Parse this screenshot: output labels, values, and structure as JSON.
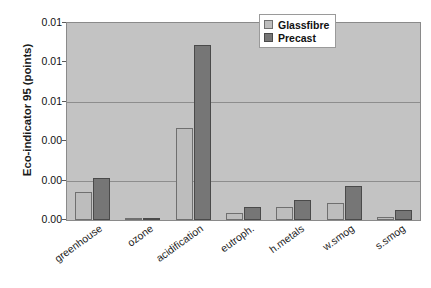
{
  "chart_data": {
    "type": "bar",
    "title": "",
    "xlabel": "",
    "ylabel": "Eco-indicator 95 (points)",
    "categories": [
      "greenhouse",
      "ozone",
      "acidification",
      "eutroph.",
      "h.metals",
      "w.smog",
      "s.smog"
    ],
    "series": [
      {
        "name": "Glassfibre",
        "color": "#bdbdbd",
        "values": [
          0.0028,
          8e-05,
          0.0093,
          0.0007,
          0.0013,
          0.0017,
          0.0003
        ]
      },
      {
        "name": "Precast",
        "color": "#767676",
        "values": [
          0.0043,
          0.00025,
          0.0178,
          0.0013,
          0.002,
          0.0035,
          0.001
        ]
      }
    ],
    "ylim": [
      0,
      0.02
    ],
    "yticks": [
      0,
      0.004,
      0.008,
      0.012,
      0.016,
      0.02
    ],
    "ytick_labels": [
      "0.00",
      "0.00",
      "0.01",
      "0.01",
      "0.02",
      "0.02"
    ],
    "grid": true,
    "gridlines_at": [
      0.004,
      0.012
    ],
    "legend_position": "top-right"
  },
  "axis": {
    "y_title": "Eco-indicator 95 (points)",
    "tick_labels": [
      "0.01",
      "0.01",
      "0.01",
      "0.00",
      "0.00",
      "0.00"
    ]
  },
  "legend": {
    "entries": [
      {
        "label": "Glassfibre",
        "swatch": "glassfibre"
      },
      {
        "label": "Precast",
        "swatch": "precast"
      }
    ]
  }
}
